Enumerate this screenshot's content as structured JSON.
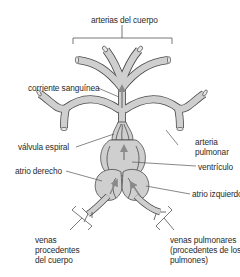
{
  "diagram": {
    "type": "labeled-anatomy",
    "colors": {
      "vessel_fill": "#cfcfcf",
      "vessel_outline": "#4a4a4a",
      "arrow": "#8a8a8a",
      "leader_line": "#555555",
      "text": "#2a2a2a",
      "background": "#ffffff"
    },
    "labels": {
      "arterias_cuerpo": "arterias del cuerpo",
      "corriente_sanguinea": "corriente sanguínea",
      "valvula_espiral": "válvula espiral",
      "arteria_pulmonar_1": "arteria",
      "arteria_pulmonar_2": "pulmonar",
      "ventriculo": "ventrículo",
      "atrio_derecho": "atrio derecho",
      "atrio_izquierdo": "atrio izquierdo",
      "venas_cuerpo_1": "venas",
      "venas_cuerpo_2": "procedentes",
      "venas_cuerpo_3": "del cuerpo",
      "venas_pulmonares_1": "venas pulmonares",
      "venas_pulmonares_2": "(procedentes de los",
      "venas_pulmonares_3": "pulmones)"
    }
  }
}
